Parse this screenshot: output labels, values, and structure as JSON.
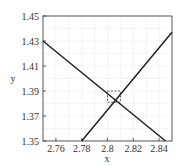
{
  "chart_data": {
    "type": "line",
    "title": "",
    "xlabel": "x",
    "ylabel": "y",
    "xlim": [
      2.75,
      2.85
    ],
    "ylim": [
      1.35,
      1.45
    ],
    "x_ticks": [
      "2.76",
      "2.78",
      "2.8",
      "2.82",
      "2.84"
    ],
    "x_tick_values": [
      2.76,
      2.78,
      2.8,
      2.82,
      2.84
    ],
    "y_ticks": [
      "1.35",
      "1.37",
      "1.39",
      "1.41",
      "1.43",
      "1.45"
    ],
    "y_tick_values": [
      1.35,
      1.37,
      1.39,
      1.41,
      1.43,
      1.45
    ],
    "grid": true,
    "legend": null,
    "series": [
      {
        "name": "descending line",
        "x": [
          2.75,
          2.845
        ],
        "y": [
          1.43,
          1.35
        ],
        "color": "#1a1a1a"
      },
      {
        "name": "ascending line",
        "x": [
          2.78,
          2.85
        ],
        "y": [
          1.35,
          1.437
        ],
        "color": "#1a1a1a"
      }
    ],
    "annotations": [
      {
        "type": "dashed-rectangle",
        "x": [
          2.8,
          2.81
        ],
        "y": [
          1.381,
          1.39
        ],
        "note": "intersection zoom region"
      }
    ],
    "intersection_approx": {
      "x": 2.806,
      "y": 1.383
    }
  }
}
